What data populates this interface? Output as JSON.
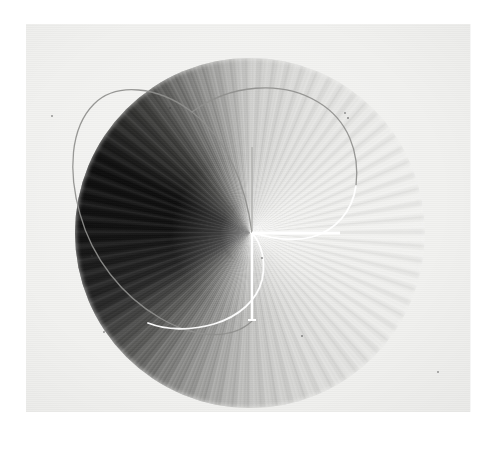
{
  "figure": {
    "kind": "scanned-photograph",
    "medium": "halftone print on paper",
    "caption": "",
    "title": "",
    "axis_labels": [],
    "tick_labels": [],
    "legend": [],
    "annotations": []
  },
  "page": {
    "background_color": "#ffffff",
    "sheet_color": "#f2f2f0",
    "sheet": {
      "x": 26,
      "y": 24,
      "width": 444,
      "height": 388
    },
    "seam_x": 470
  },
  "chart_data": {
    "type": "heatmap",
    "title": "",
    "subtitle": "",
    "xlabel": "",
    "ylabel": "",
    "projection": "polar",
    "grid": false,
    "legend_position": "none",
    "disc": {
      "center_x": 250,
      "center_y": 233,
      "radius": 175,
      "bounds": {
        "left": 75,
        "top": 58,
        "right": 425,
        "bottom": 408
      }
    },
    "angle_unit": "degrees",
    "angles": [
      0,
      30,
      60,
      90,
      120,
      150,
      180,
      210,
      240,
      270,
      300,
      330,
      360
    ],
    "intensity": [
      0.3,
      0.16,
      0.07,
      0.05,
      0.06,
      0.12,
      0.34,
      0.7,
      0.9,
      0.94,
      0.92,
      0.72,
      0.3
    ],
    "intensity_range": [
      0.0,
      1.0
    ],
    "intensity_note": "0 = white (maximum brightness), 1 = black (minimum brightness)",
    "gray_stops": [
      {
        "angle": 0,
        "hex": "#cfcfcd"
      },
      {
        "angle": 25,
        "hex": "#e3e3e1"
      },
      {
        "angle": 55,
        "hex": "#f0f0ee"
      },
      {
        "angle": 90,
        "hex": "#f4f4f2"
      },
      {
        "angle": 125,
        "hex": "#eeeeec"
      },
      {
        "angle": 155,
        "hex": "#dededc"
      },
      {
        "angle": 180,
        "hex": "#c4c4c2"
      },
      {
        "angle": 205,
        "hex": "#8e8e8c"
      },
      {
        "angle": 225,
        "hex": "#5a5a58"
      },
      {
        "angle": 245,
        "hex": "#262626"
      },
      {
        "angle": 270,
        "hex": "#101010"
      },
      {
        "angle": 295,
        "hex": "#0d0d0d"
      },
      {
        "angle": 320,
        "hex": "#3a3a38"
      },
      {
        "angle": 340,
        "hex": "#8a8a88"
      },
      {
        "angle": 360,
        "hex": "#cfcfcd"
      }
    ],
    "fringes": {
      "present": true,
      "kind": "radial",
      "origin": "disc center",
      "approx_count": 360,
      "strongest_sector": "lower / lower-left"
    },
    "overlay_curve": {
      "name": "limacon-loop",
      "closed": true,
      "stroke_dark_hex": "#8f8f8d",
      "stroke_light_hex": "#ffffff",
      "stroke_width": 1.4,
      "note": "thin closed loop drawn dark over the bright sectors and white over the dark sectors"
    },
    "axis_markers": [
      {
        "name": "vertical-up-tick",
        "from": [
          252,
          233
        ],
        "to": [
          252,
          147
        ],
        "color": "#a8a8a6",
        "width": 1.2
      },
      {
        "name": "vertical-down-tick",
        "from": [
          252,
          233
        ],
        "to": [
          252,
          321
        ],
        "color": "#ffffff",
        "width": 2.4
      },
      {
        "name": "horizontal-right-tick",
        "from": [
          252,
          233
        ],
        "to": [
          340,
          233
        ],
        "color": "#ffffff",
        "width": 3.0
      }
    ]
  },
  "specks": [
    {
      "x": 170,
      "y": 108,
      "r": 1.0
    },
    {
      "x": 345,
      "y": 113,
      "r": 1.0
    },
    {
      "x": 52,
      "y": 116,
      "r": 1.2
    },
    {
      "x": 348,
      "y": 118,
      "r": 0.8
    },
    {
      "x": 203,
      "y": 232,
      "r": 0.9
    },
    {
      "x": 92,
      "y": 256,
      "r": 1.1
    },
    {
      "x": 262,
      "y": 258,
      "r": 0.8
    },
    {
      "x": 104,
      "y": 332,
      "r": 0.9
    },
    {
      "x": 302,
      "y": 336,
      "r": 0.8
    },
    {
      "x": 438,
      "y": 372,
      "r": 1.0
    }
  ]
}
